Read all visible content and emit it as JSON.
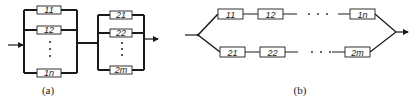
{
  "figure": {
    "panels": [
      {
        "id": "a",
        "caption": "(a)",
        "description": "Series connection of two parallel groups",
        "group1": {
          "blocks": [
            "11",
            "12",
            "1n"
          ],
          "ellipsis": "⋮"
        },
        "group2": {
          "blocks": [
            "21",
            "22",
            "2m"
          ],
          "ellipsis": "⋮"
        }
      },
      {
        "id": "b",
        "caption": "(b)",
        "description": "Parallel connection of two series chains",
        "chain1": {
          "blocks": [
            "11",
            "12",
            "1n"
          ],
          "ellipsis": "· · ·"
        },
        "chain2": {
          "blocks": [
            "21",
            "22",
            "2m"
          ],
          "ellipsis": "· · ·"
        }
      }
    ]
  }
}
